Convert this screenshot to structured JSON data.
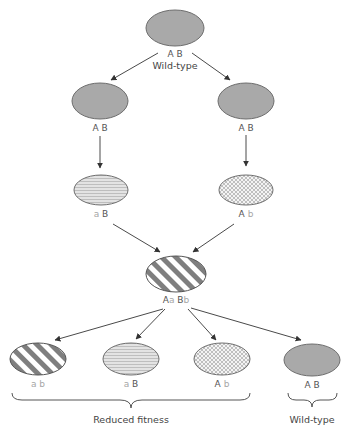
{
  "diagram": {
    "colors": {
      "wildtype_fill": "#a9a9a9",
      "outline": "#6e6e6e",
      "stripe_dark": "#7f7f7f",
      "stripe_light": "#ffffff",
      "hatch_fill": "#e0e0e0",
      "crosshatch_fill": "#f2f2f2",
      "arrow": "#4a4a4a",
      "lowercase_text": "#a6a6a6"
    },
    "root": {
      "genotype": {
        "A": "A",
        "B": "B"
      },
      "caption": "Wild-type"
    },
    "faint_labels": [
      "",
      ""
    ],
    "level2": [
      {
        "genotype": {
          "A": "A",
          "B": "B"
        }
      },
      {
        "genotype": {
          "A": "A",
          "B": "B"
        }
      }
    ],
    "level3": [
      {
        "genotype": {
          "A": "a",
          "B": "B"
        },
        "pattern": "horizontal-lines"
      },
      {
        "genotype": {
          "A": "A",
          "B": "b"
        },
        "pattern": "crosshatch"
      }
    ],
    "hybrid": {
      "genotype_parts": [
        "A",
        "a",
        " B",
        "b"
      ],
      "pattern": "diagonal-stripes"
    },
    "offspring": [
      {
        "genotype": {
          "A": "a",
          "B": "b"
        },
        "pattern": "diagonal-stripes"
      },
      {
        "genotype": {
          "A": "a",
          "B": "B"
        },
        "pattern": "horizontal-lines"
      },
      {
        "genotype": {
          "A": "A",
          "B": "b"
        },
        "pattern": "crosshatch"
      },
      {
        "genotype": {
          "A": "A",
          "B": "B"
        },
        "pattern": "solid-gray"
      }
    ],
    "groups": {
      "reduced": "Reduced fitness",
      "wildtype": "Wild-type"
    }
  }
}
